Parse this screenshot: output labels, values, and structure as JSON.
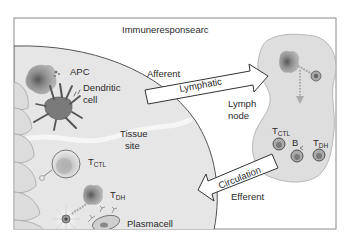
{
  "title": "Immuneresponsearc",
  "colors": {
    "frame": "#8a8a8a",
    "tissue_fill": "#e6e6e6",
    "lymph_fill": "#dedede",
    "text": "#2a2a2a",
    "cell_dark": "#6e6e6e",
    "arrow_fill": "#ffffff"
  },
  "regions": {
    "tissue": {
      "label_line1": "Tissue",
      "label_line2": "site"
    },
    "lymph_node": {
      "label_line1": "Lymph",
      "label_line2": "node"
    }
  },
  "labels": {
    "apc": "APC",
    "dendritic_line1": "Dendritic",
    "dendritic_line2": "cell",
    "afferent": "Afferent",
    "efferent": "Efferent",
    "plasmacell": "Plasmacell"
  },
  "arrows": {
    "lymphatic": "Lymphatic",
    "circulation": "Circulation"
  },
  "cells": {
    "tissue_tctl": {
      "main": "T",
      "sub": "CTL"
    },
    "tissue_tdh": {
      "main": "T",
      "sub": "DH"
    },
    "node_tctl": {
      "main": "T",
      "sub": "CTL"
    },
    "node_b": {
      "main": "B",
      "sub": ""
    },
    "node_tdh": {
      "main": "T",
      "sub": "DH"
    }
  }
}
